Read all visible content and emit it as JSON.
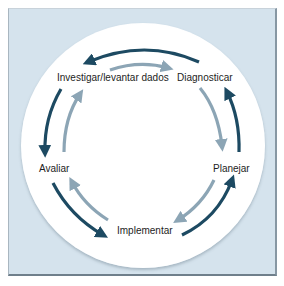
{
  "diagram": {
    "type": "cycle",
    "nodes": [
      {
        "id": "investigar",
        "label": "Investigar/levantar dados"
      },
      {
        "id": "diagnosticar",
        "label": "Diagnosticar"
      },
      {
        "id": "planejar",
        "label": "Planejar"
      },
      {
        "id": "implementar",
        "label": "Implementar"
      },
      {
        "id": "avaliar",
        "label": "Avaliar"
      }
    ],
    "edges": {
      "outer_dark_counterclockwise": [
        {
          "from": "diagnosticar",
          "to": "investigar"
        },
        {
          "from": "investigar",
          "to": "avaliar"
        },
        {
          "from": "avaliar",
          "to": "implementar"
        },
        {
          "from": "implementar",
          "to": "planejar"
        },
        {
          "from": "planejar",
          "to": "diagnosticar"
        }
      ],
      "inner_light_clockwise": [
        {
          "from": "investigar",
          "to": "diagnosticar"
        },
        {
          "from": "diagnosticar",
          "to": "planejar"
        },
        {
          "from": "planejar",
          "to": "implementar"
        },
        {
          "from": "implementar",
          "to": "avaliar"
        },
        {
          "from": "avaliar",
          "to": "investigar"
        }
      ]
    },
    "colors": {
      "dark_arrow": "#1d4a62",
      "light_arrow": "#8ca5b5",
      "frame_background": "#d5e3ed",
      "ring_inner": "#ffffff"
    }
  }
}
